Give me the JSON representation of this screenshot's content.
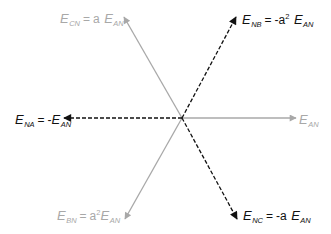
{
  "diagram": {
    "title": "",
    "origin": [
      182,
      118
    ],
    "colors": {
      "reference": "#a8a8a8",
      "reversed": "#111111"
    },
    "phasors": [
      {
        "id": "E_AN",
        "tip": [
          296,
          118
        ],
        "style": "solid",
        "color": "#a8a8a8",
        "label": {
          "E": "E",
          "sub": "AN",
          "eq": "",
          "coef": "",
          "sup": "",
          "E2": "",
          "sub2": ""
        }
      },
      {
        "id": "E_CN",
        "tip": [
          124,
          17
        ],
        "style": "solid",
        "color": "#a8a8a8",
        "label": {
          "E": "E",
          "sub": "CN",
          "eq": "=",
          "coef": "a",
          "sup": "",
          "E2": "E",
          "sub2": "AN"
        }
      },
      {
        "id": "E_BN",
        "tip": [
          125,
          219
        ],
        "style": "solid",
        "color": "#a8a8a8",
        "label": {
          "E": "E",
          "sub": "BN",
          "eq": "=",
          "coef": "a",
          "sup": "2",
          "E2": "E",
          "sub2": "AN"
        }
      },
      {
        "id": "E_NA",
        "tip": [
          64,
          118
        ],
        "style": "dashed",
        "color": "#111111",
        "label": {
          "E": "E",
          "sub": "NA",
          "eq": "=",
          "coef": "-",
          "sup": "",
          "E2": "E",
          "sub2": "AN"
        }
      },
      {
        "id": "E_NB",
        "tip": [
          236,
          17
        ],
        "style": "dashed",
        "color": "#111111",
        "label": {
          "E": "E",
          "sub": "NB",
          "eq": "=",
          "coef": "-a",
          "sup": "2",
          "E2": "E",
          "sub2": "AN"
        }
      },
      {
        "id": "E_NC",
        "tip": [
          237,
          219
        ],
        "style": "dashed",
        "color": "#111111",
        "label": {
          "E": "E",
          "sub": "NC",
          "eq": "=",
          "coef": "-a",
          "sup": "",
          "E2": "E",
          "sub2": "AN"
        }
      }
    ]
  }
}
